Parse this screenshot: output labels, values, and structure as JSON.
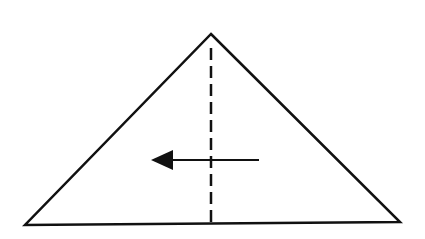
{
  "diagram": {
    "type": "origami-fold-step",
    "background": "#ffffff",
    "stroke_color": "#111111",
    "triangle": {
      "apex": [
        211,
        34
      ],
      "bottom_left": [
        25,
        225
      ],
      "bottom_right": [
        400,
        222
      ],
      "stroke_width": 2.5
    },
    "fold_line": {
      "style": "valley-fold-dashed",
      "x": 211,
      "y_start": 48,
      "y_end": 225,
      "dash": "12 6",
      "stroke_width": 2.5
    },
    "arrow": {
      "direction": "left",
      "meaning": "fold right half over to the left",
      "tail": [
        259,
        160
      ],
      "head_base_x": 173,
      "tip": [
        151,
        160
      ],
      "head_half_height": 10,
      "stroke_width": 2
    }
  }
}
